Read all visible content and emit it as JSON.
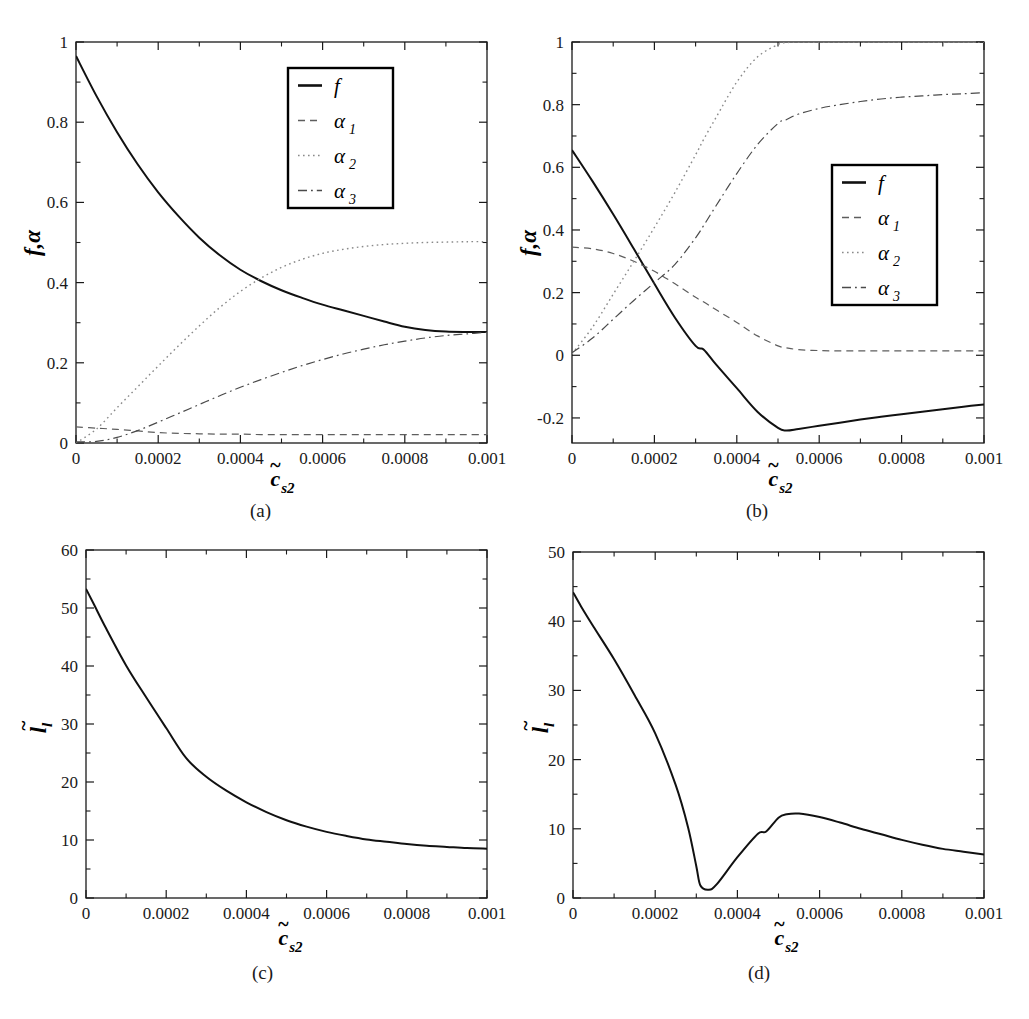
{
  "figure": {
    "background": "#ffffff",
    "line_color": "#1a1a1a",
    "faint_color": "#6e6e6e"
  },
  "panels": [
    {
      "id": "a",
      "caption": "(a)",
      "xlabel_base": "c",
      "xlabel_sub": "s2",
      "xlabel_tilde": "~",
      "ylabel_base": "f,",
      "ylabel_alpha": "α",
      "ylabel_sub": "",
      "xticks": [
        "0",
        "0.0002",
        "0.0004",
        "0.0006",
        "0.0008",
        "0.001"
      ],
      "yticks": [
        "0",
        "0.2",
        "0.4",
        "0.6",
        "0.8",
        "1"
      ],
      "legend": [
        {
          "label": "f",
          "sub": "",
          "style": "solid"
        },
        {
          "label": "α",
          "sub": "1",
          "style": "dashed"
        },
        {
          "label": "α",
          "sub": "2",
          "style": "dotted"
        },
        {
          "label": "α",
          "sub": "3",
          "style": "dashdot"
        }
      ]
    },
    {
      "id": "b",
      "caption": "(b)",
      "xlabel_base": "c",
      "xlabel_sub": "s2",
      "xlabel_tilde": "~",
      "ylabel_base": "f,",
      "ylabel_alpha": "α",
      "ylabel_sub": "",
      "xticks": [
        "0",
        "0.0002",
        "0.0004",
        "0.0006",
        "0.0008",
        "0.001"
      ],
      "yticks": [
        "-0.2",
        "0",
        "0.2",
        "0.4",
        "0.6",
        "0.8",
        "1"
      ],
      "legend": [
        {
          "label": "f",
          "sub": "",
          "style": "solid"
        },
        {
          "label": "α",
          "sub": "1",
          "style": "dashed"
        },
        {
          "label": "α",
          "sub": "2",
          "style": "dotted"
        },
        {
          "label": "α",
          "sub": "3",
          "style": "dashdot"
        }
      ]
    },
    {
      "id": "c",
      "caption": "(c)",
      "xlabel_base": "c",
      "xlabel_sub": "s2",
      "xlabel_tilde": "~",
      "ylabel_base": "l",
      "ylabel_sub": "l",
      "xticks": [
        "0",
        "0.0002",
        "0.0004",
        "0.0006",
        "0.0008",
        "0.001"
      ],
      "yticks": [
        "0",
        "10",
        "20",
        "30",
        "40",
        "50",
        "60"
      ],
      "legend": []
    },
    {
      "id": "d",
      "caption": "(d)",
      "xlabel_base": "c",
      "xlabel_sub": "s2",
      "xlabel_tilde": "~",
      "ylabel_base": "l",
      "ylabel_sub": "l",
      "xticks": [
        "0",
        "0.0002",
        "0.0004",
        "0.0006",
        "0.0008",
        "0.001"
      ],
      "yticks": [
        "0",
        "10",
        "20",
        "30",
        "40",
        "50"
      ],
      "legend": []
    }
  ],
  "chart_data": [
    {
      "panel": "a",
      "type": "line",
      "title": "",
      "xlabel": "c~_s2",
      "ylabel": "f, alpha",
      "xlim": [
        0,
        0.001
      ],
      "ylim": [
        0,
        1
      ],
      "xticks": [
        0,
        0.0002,
        0.0004,
        0.0006,
        0.0008,
        0.001
      ],
      "yticks": [
        0,
        0.2,
        0.4,
        0.6,
        0.8,
        1
      ],
      "grid": false,
      "legend_position": "upper-right",
      "x": [
        0,
        5e-05,
        0.0001,
        0.00015,
        0.0002,
        0.00025,
        0.0003,
        0.00035,
        0.0004,
        0.00045,
        0.0005,
        0.00055,
        0.0006,
        0.00065,
        0.0007,
        0.00075,
        0.0008,
        0.00085,
        0.0009,
        0.00095,
        0.001
      ],
      "series": [
        {
          "name": "f",
          "style": "solid",
          "values": [
            0.965,
            0.865,
            0.775,
            0.695,
            0.625,
            0.565,
            0.512,
            0.468,
            0.432,
            0.404,
            0.381,
            0.362,
            0.345,
            0.331,
            0.317,
            0.303,
            0.29,
            0.282,
            0.278,
            0.277,
            0.277
          ]
        },
        {
          "name": "alpha_1",
          "style": "dashed",
          "values": [
            0.04,
            0.037,
            0.034,
            0.03,
            0.026,
            0.024,
            0.023,
            0.022,
            0.022,
            0.021,
            0.021,
            0.021,
            0.021,
            0.021,
            0.021,
            0.021,
            0.021,
            0.021,
            0.021,
            0.021,
            0.021
          ]
        },
        {
          "name": "alpha_2",
          "style": "dotted",
          "values": [
            0.0,
            0.035,
            0.088,
            0.14,
            0.192,
            0.243,
            0.292,
            0.338,
            0.378,
            0.411,
            0.438,
            0.458,
            0.473,
            0.483,
            0.49,
            0.495,
            0.498,
            0.5,
            0.501,
            0.502,
            0.502
          ]
        },
        {
          "name": "alpha_3",
          "style": "dashdot",
          "values": [
            0.003,
            0.004,
            0.014,
            0.031,
            0.052,
            0.074,
            0.096,
            0.118,
            0.139,
            0.158,
            0.176,
            0.193,
            0.208,
            0.222,
            0.234,
            0.245,
            0.254,
            0.262,
            0.268,
            0.272,
            0.276
          ]
        }
      ]
    },
    {
      "panel": "b",
      "type": "line",
      "title": "",
      "xlabel": "c~_s2",
      "ylabel": "f, alpha",
      "xlim": [
        0,
        0.001
      ],
      "ylim": [
        -0.28,
        1.0
      ],
      "xticks": [
        0,
        0.0002,
        0.0004,
        0.0006,
        0.0008,
        0.001
      ],
      "yticks": [
        -0.2,
        0,
        0.2,
        0.4,
        0.6,
        0.8,
        1
      ],
      "grid": false,
      "legend_position": "center-right",
      "x": [
        0,
        5e-05,
        0.0001,
        0.00015,
        0.0002,
        0.00025,
        0.0003,
        0.00032,
        0.00035,
        0.0004,
        0.00045,
        0.0005,
        0.00052,
        0.00055,
        0.0006,
        0.00065,
        0.0007,
        0.00075,
        0.0008,
        0.00085,
        0.0009,
        0.00095,
        0.001
      ],
      "series": [
        {
          "name": "f",
          "style": "solid",
          "values": [
            0.655,
            0.555,
            0.45,
            0.34,
            0.228,
            0.12,
            0.03,
            0.018,
            -0.03,
            -0.105,
            -0.18,
            -0.232,
            -0.24,
            -0.235,
            -0.225,
            -0.215,
            -0.205,
            -0.196,
            -0.188,
            -0.18,
            -0.172,
            -0.164,
            -0.157
          ]
        },
        {
          "name": "alpha_1",
          "style": "dashed",
          "values": [
            0.345,
            0.34,
            0.325,
            0.3,
            0.268,
            0.228,
            0.185,
            0.17,
            0.145,
            0.105,
            0.062,
            0.03,
            0.024,
            0.018,
            0.015,
            0.014,
            0.014,
            0.014,
            0.014,
            0.014,
            0.014,
            0.014,
            0.014
          ]
        },
        {
          "name": "alpha_2",
          "style": "dotted",
          "values": [
            0.005,
            0.09,
            0.195,
            0.3,
            0.408,
            0.52,
            0.64,
            0.69,
            0.76,
            0.872,
            0.952,
            0.992,
            0.998,
            1.0,
            1.0,
            1.0,
            1.0,
            1.0,
            1.0,
            1.0,
            1.0,
            1.0,
            1.0
          ]
        },
        {
          "name": "alpha_3",
          "style": "dashdot",
          "values": [
            0.008,
            0.055,
            0.115,
            0.175,
            0.232,
            0.29,
            0.375,
            0.415,
            0.478,
            0.58,
            0.672,
            0.74,
            0.752,
            0.77,
            0.788,
            0.8,
            0.81,
            0.818,
            0.824,
            0.828,
            0.832,
            0.835,
            0.838
          ]
        }
      ]
    },
    {
      "panel": "c",
      "type": "line",
      "title": "",
      "xlabel": "c~_s2",
      "ylabel": "l~_l",
      "xlim": [
        0,
        0.001
      ],
      "ylim": [
        0,
        60
      ],
      "xticks": [
        0,
        0.0002,
        0.0004,
        0.0006,
        0.0008,
        0.001
      ],
      "yticks": [
        0,
        10,
        20,
        30,
        40,
        50,
        60
      ],
      "grid": false,
      "legend_position": "none",
      "x": [
        0,
        2e-05,
        5e-05,
        0.0001,
        0.00015,
        0.0002,
        0.00025,
        0.0003,
        0.00035,
        0.0004,
        0.00045,
        0.0005,
        0.00055,
        0.0006,
        0.00065,
        0.0007,
        0.00075,
        0.0008,
        0.00085,
        0.0009,
        0.00095,
        0.001
      ],
      "series": [
        {
          "name": "l_tilde",
          "style": "solid",
          "values": [
            53.3,
            50.6,
            46.5,
            40.1,
            34.6,
            29.3,
            24.1,
            20.9,
            18.5,
            16.5,
            14.8,
            13.4,
            12.3,
            11.4,
            10.7,
            10.1,
            9.7,
            9.3,
            9.0,
            8.8,
            8.6,
            8.5
          ]
        }
      ]
    },
    {
      "panel": "d",
      "type": "line",
      "title": "",
      "xlabel": "c~_s2",
      "ylabel": "l~_l",
      "xlim": [
        0,
        0.001
      ],
      "ylim": [
        0,
        50
      ],
      "xticks": [
        0,
        0.0002,
        0.0004,
        0.0006,
        0.0008,
        0.001
      ],
      "yticks": [
        0,
        10,
        20,
        30,
        40,
        50
      ],
      "grid": false,
      "legend_position": "none",
      "x": [
        0,
        2e-05,
        5e-05,
        0.0001,
        0.00015,
        0.0002,
        0.00025,
        0.00028,
        0.0003,
        0.00031,
        0.00033,
        0.00035,
        0.0004,
        0.00045,
        0.00047,
        0.0005,
        0.00052,
        0.00055,
        0.0006,
        0.00065,
        0.0007,
        0.00075,
        0.0008,
        0.00085,
        0.0009,
        0.00095,
        0.001
      ],
      "series": [
        {
          "name": "l_tilde",
          "style": "solid",
          "values": [
            44.2,
            42.1,
            39.2,
            34.5,
            29.3,
            23.8,
            16.3,
            10.2,
            4.6,
            1.8,
            1.2,
            2.0,
            5.9,
            9.3,
            9.6,
            11.6,
            12.1,
            12.2,
            11.7,
            10.9,
            10.0,
            9.2,
            8.4,
            7.7,
            7.1,
            6.7,
            6.3
          ]
        }
      ]
    }
  ]
}
